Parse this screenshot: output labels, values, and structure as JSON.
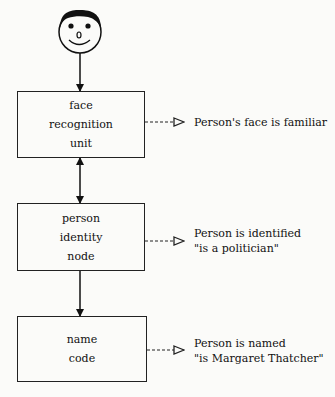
{
  "diagram": {
    "top_icon": "smiley-face-icon",
    "nodes": [
      {
        "id": "face-recognition-unit",
        "lines": [
          "face",
          "recognition",
          "unit"
        ]
      },
      {
        "id": "person-identity-node",
        "lines": [
          "person",
          "identity",
          "node"
        ]
      },
      {
        "id": "name-code",
        "lines": [
          "name",
          "code"
        ]
      }
    ],
    "outputs": [
      {
        "lines": [
          "Person's face is familiar"
        ]
      },
      {
        "lines": [
          "Person is identified",
          "\"is a politician\""
        ]
      },
      {
        "lines": [
          "Person is named",
          "\"is Margaret Thatcher\""
        ]
      }
    ],
    "edges": [
      {
        "from": "face",
        "to": "face-recognition-unit",
        "direction": "one-way"
      },
      {
        "from": "face-recognition-unit",
        "to": "person-identity-node",
        "direction": "two-way"
      },
      {
        "from": "person-identity-node",
        "to": "name-code",
        "direction": "one-way"
      }
    ]
  }
}
